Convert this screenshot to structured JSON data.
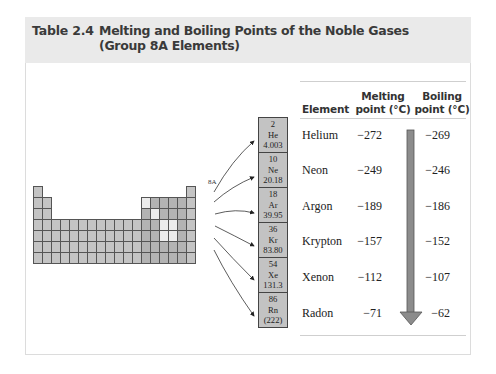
{
  "table": {
    "number": "Table 2.4",
    "title_line1": "Melting and Boiling Points of the Noble Gases",
    "title_line2": "(Group 8A Elements)"
  },
  "periodic_table": {
    "group_label": "8A",
    "noble_gas_boxes": [
      {
        "atomic_number": "2",
        "symbol": "He",
        "mass": "4.003"
      },
      {
        "atomic_number": "10",
        "symbol": "Ne",
        "mass": "20.18"
      },
      {
        "atomic_number": "18",
        "symbol": "Ar",
        "mass": "39.95"
      },
      {
        "atomic_number": "36",
        "symbol": "Kr",
        "mass": "83.80"
      },
      {
        "atomic_number": "54",
        "symbol": "Xe",
        "mass": "131.3"
      },
      {
        "atomic_number": "86",
        "symbol": "Rn",
        "mass": "(222)"
      }
    ]
  },
  "data_table": {
    "headers": {
      "element": "Element",
      "melting_line1": "Melting",
      "melting_line2": "point (°C)",
      "boiling_line1": "Boiling",
      "boiling_line2": "point (°C)"
    },
    "rows": [
      {
        "element": "Helium",
        "melting": "−272",
        "boiling": "−269"
      },
      {
        "element": "Neon",
        "melting": "−249",
        "boiling": "−246"
      },
      {
        "element": "Argon",
        "melting": "−189",
        "boiling": "−186"
      },
      {
        "element": "Krypton",
        "melting": "−157",
        "boiling": "−152"
      },
      {
        "element": "Xenon",
        "melting": "−112",
        "boiling": "−107"
      },
      {
        "element": "Radon",
        "melting": "−71",
        "boiling": "−62"
      }
    ],
    "trend_arrow_icon": "down-arrow-icon"
  }
}
